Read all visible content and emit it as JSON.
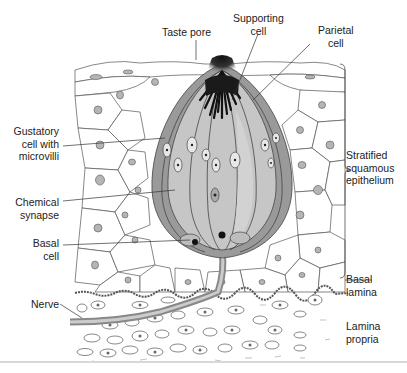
{
  "figure": {
    "labels": {
      "taste_pore": "Taste pore",
      "supporting_cell": [
        "Supporting",
        "cell"
      ],
      "parietal_cell": [
        "Parietal",
        "cell"
      ],
      "gustatory_cell": [
        "Gustatory",
        "cell with",
        "microvilli"
      ],
      "chemical_synapse": [
        "Chemical",
        "synapse"
      ],
      "basal_cell": [
        "Basal",
        "cell"
      ],
      "nerve": "Nerve",
      "stratified_epithelium": [
        "Stratified",
        "squamous",
        "epithelium"
      ],
      "basal_lamina": [
        "Basal",
        "lamina"
      ],
      "lamina_propria": [
        "Lamina",
        "propria"
      ]
    },
    "colors": {
      "bud_outer": "#9a9a9a",
      "bud_inner": "#c4c4c4",
      "pore_dark": "#1a1a1a",
      "cell_outline": "#555555",
      "nucleus": "#b0b0b0",
      "leader": "#333333"
    }
  }
}
